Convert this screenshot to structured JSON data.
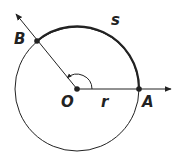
{
  "diagram": {
    "labels": {
      "center": "O",
      "point_a": "A",
      "point_b": "B",
      "radius": "r",
      "arc": "s"
    },
    "colors": {
      "stroke": "#222222",
      "background": "#ffffff"
    }
  }
}
